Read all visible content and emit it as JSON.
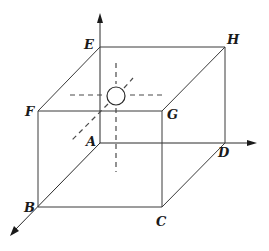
{
  "diagram": {
    "title": "",
    "type": "cube-with-coordinate-axes",
    "vertices": {
      "A": {
        "label": "A",
        "x": 100,
        "y": 143
      },
      "B": {
        "label": "B",
        "x": 38,
        "y": 207
      },
      "C": {
        "label": "C",
        "x": 162,
        "y": 207
      },
      "D": {
        "label": "D",
        "x": 225,
        "y": 143
      },
      "E": {
        "label": "E",
        "x": 100,
        "y": 47
      },
      "F": {
        "label": "F",
        "x": 38,
        "y": 111
      },
      "G": {
        "label": "G",
        "x": 162,
        "y": 111
      },
      "H": {
        "label": "H",
        "x": 225,
        "y": 47
      }
    },
    "edges": [
      [
        "A",
        "B"
      ],
      [
        "B",
        "C"
      ],
      [
        "C",
        "D"
      ],
      [
        "D",
        "A"
      ],
      [
        "E",
        "F"
      ],
      [
        "F",
        "G"
      ],
      [
        "G",
        "H"
      ],
      [
        "H",
        "E"
      ],
      [
        "A",
        "E"
      ],
      [
        "B",
        "F"
      ],
      [
        "C",
        "G"
      ],
      [
        "D",
        "H"
      ]
    ],
    "axes": [
      {
        "name": "vertical-axis",
        "from": "A",
        "direction": "up"
      },
      {
        "name": "right-axis",
        "from": "A",
        "direction": "right"
      },
      {
        "name": "front-axis",
        "from": "A",
        "direction": "down-left"
      }
    ],
    "sphere": {
      "label": "",
      "center_x": 116,
      "center_y": 96,
      "radius": 9
    },
    "dashed_lines": [
      "horizontal-through-sphere",
      "vertical-through-sphere",
      "diagonal-through-sphere"
    ],
    "colors": {
      "line": "#3a3a3a",
      "text": "#1a1a1a",
      "background": "#ffffff"
    }
  }
}
